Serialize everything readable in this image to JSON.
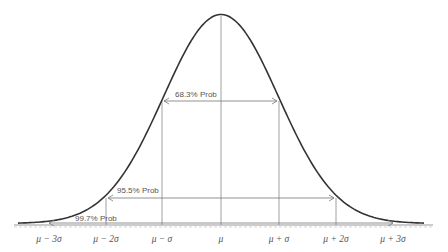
{
  "diagram": {
    "curve_color": "#333333",
    "line_color": "#888888",
    "x_ticks": [
      {
        "label": "μ − 3σ",
        "x": 49
      },
      {
        "label": "μ − 2σ",
        "x": 106
      },
      {
        "label": "μ − σ",
        "x": 162
      },
      {
        "label": "μ",
        "x": 221
      },
      {
        "label": "μ + σ",
        "x": 279
      },
      {
        "label": "μ + 2σ",
        "x": 336
      },
      {
        "label": "μ + 3σ",
        "x": 393
      }
    ],
    "intervals": [
      {
        "label": "68.3% Prob",
        "from": "μ − σ",
        "to": "μ + σ"
      },
      {
        "label": "95.5% Prob",
        "from": "μ − 2σ",
        "to": "μ + 2σ"
      },
      {
        "label": "99.7% Prob",
        "from": "μ − 3σ",
        "to": "μ + 3σ"
      }
    ]
  }
}
